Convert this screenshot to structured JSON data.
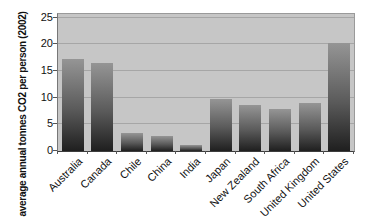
{
  "chart_data": {
    "type": "bar",
    "title": "",
    "xlabel": "",
    "ylabel": "average annual tonnes CO2 per person (2002)",
    "categories": [
      "Australia",
      "Canada",
      "Chile",
      "China",
      "India",
      "Japan",
      "New Zealand",
      "South Africa",
      "United Kingdom",
      "United States"
    ],
    "values": [
      17.3,
      16.5,
      3.3,
      2.9,
      1.1,
      9.7,
      8.7,
      7.9,
      9.1,
      20.2
    ],
    "yticks": [
      0,
      5,
      10,
      15,
      20,
      25
    ],
    "ylim": [
      0,
      25
    ],
    "grid": "horizontal",
    "legend_position": "none",
    "colors": {
      "page_background": "#ffffff",
      "plot_background": "#c6c6c6",
      "gridline": "#a6a6a6",
      "bar_gradient_top": "#959595",
      "bar_gradient_mid": "#5a5a5a",
      "bar_gradient_bottom": "#1f1f1f",
      "axis_text": "#111111"
    }
  }
}
